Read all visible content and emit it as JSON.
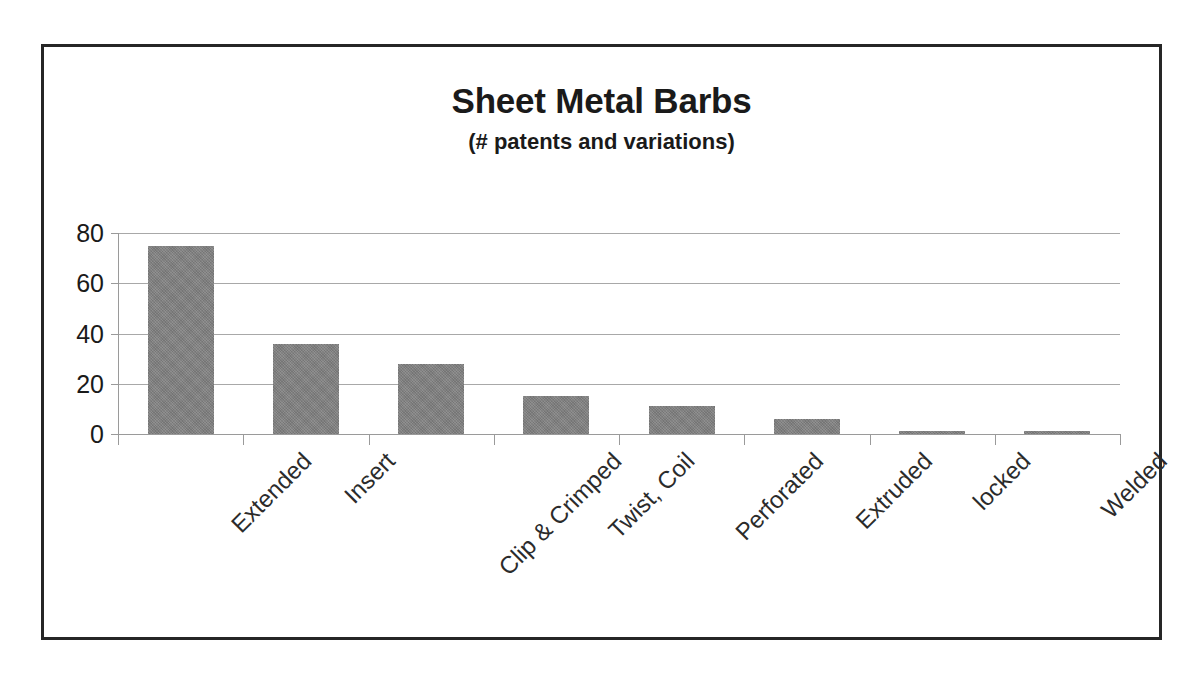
{
  "chart_data": {
    "type": "bar",
    "title": "Sheet Metal Barbs",
    "subtitle": "(# patents and variations)",
    "xlabel": "",
    "ylabel": "",
    "categories": [
      "Extended",
      "Insert",
      "Clip & Crimped",
      "Twist, Coil",
      "Perforated",
      "Extruded",
      "locked",
      "Welded"
    ],
    "values": [
      75,
      36,
      28,
      15,
      11,
      6,
      1,
      1
    ],
    "ylim": [
      0,
      80
    ],
    "yticks": [
      0,
      20,
      40,
      60,
      80
    ],
    "ytick_labels": [
      "0",
      "20",
      "40",
      "60",
      "80"
    ],
    "grid": true,
    "legend": false,
    "bar_color": "#808080",
    "axis_color": "#9a9a9a",
    "gridline_color": "#a8a8a8",
    "frame_color": "#262626",
    "background_color": "#ffffff",
    "label_rotation": -45
  }
}
